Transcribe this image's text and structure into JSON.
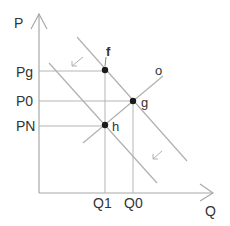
{
  "axes": {
    "y_label": "P",
    "x_label": "Q"
  },
  "price_labels": [
    {
      "label": "Pg",
      "y": 72
    },
    {
      "label": "P0",
      "y": 101
    },
    {
      "label": "PN",
      "y": 126
    }
  ],
  "quantity_labels": [
    {
      "label": "Q1",
      "x": 105
    },
    {
      "label": "Q0",
      "x": 133
    }
  ],
  "points": [
    {
      "label": "f",
      "x": 105,
      "y": 70
    },
    {
      "label": "g",
      "x": 133,
      "y": 101
    },
    {
      "label": "h",
      "x": 105,
      "y": 125
    }
  ],
  "curve_labels": {
    "o": "o"
  },
  "colors": {
    "line": "#b0b0b0",
    "axis": "#a8a8a8",
    "point": "#1a1a1a",
    "text": "#333333"
  }
}
